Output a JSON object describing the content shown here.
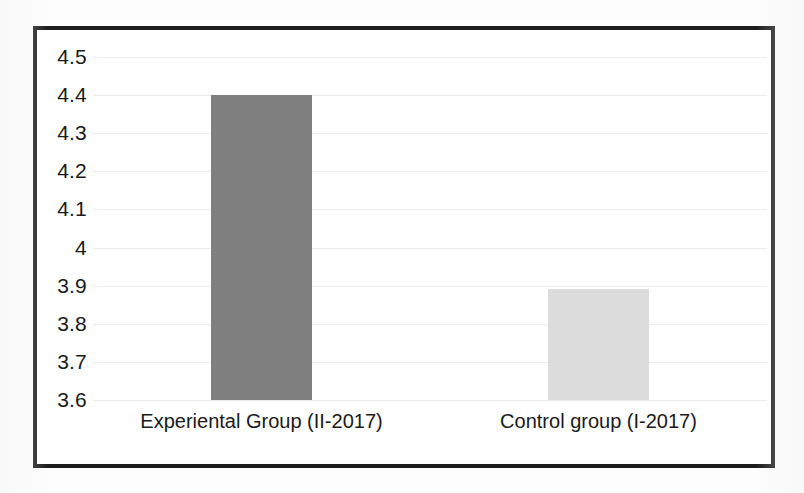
{
  "chart_data": {
    "type": "bar",
    "title": "",
    "subtitle": "",
    "xlabel": "",
    "ylabel": "",
    "categories": [
      "Experiental Group (II-2017)",
      "Control group (I-2017)"
    ],
    "values": [
      4.4,
      3.89
    ],
    "series": [
      {
        "name": "",
        "values": [
          4.4,
          3.89
        ]
      }
    ],
    "ylim": [
      3.6,
      4.5
    ],
    "y_ticks": [
      "4.5",
      "4.4",
      "4.3",
      "4.2",
      "4.1",
      "4",
      "3.9",
      "3.8",
      "3.7",
      "3.6"
    ],
    "y_tick_values": [
      4.5,
      4.4,
      4.3,
      4.2,
      4.1,
      4.0,
      3.9,
      3.8,
      3.7,
      3.6
    ],
    "grid": true,
    "legend": false,
    "legend_position": "none",
    "bar_colors": [
      "#7f7f7f",
      "#dcdcdc"
    ],
    "annotations": []
  },
  "figure": {
    "border_color": "#1c1c1c",
    "background_color": "#ffffff",
    "gridline_color": "#ececec",
    "text_color": "#1a1a1a"
  }
}
